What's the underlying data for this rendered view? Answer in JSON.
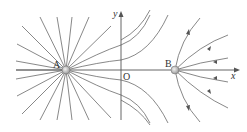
{
  "diagram": {
    "type": "electric-field-lines",
    "axes": {
      "x_label": "x",
      "y_label": "y",
      "origin_label": "O"
    },
    "charges": [
      {
        "label": "A",
        "position": "left of origin on x-axis"
      },
      {
        "label": "B",
        "position": "right of origin on x-axis"
      }
    ],
    "colors": {
      "lines": "#6a6a6a",
      "charge_fill": "#c8c8c8",
      "axis": "#555555"
    }
  }
}
